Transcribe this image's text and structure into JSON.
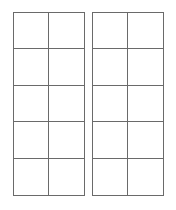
{
  "diagram": {
    "type": "ten-frames",
    "frames": [
      {
        "id": "left",
        "rows": 5,
        "columns": 2,
        "filled_cells": 0
      },
      {
        "id": "right",
        "rows": 5,
        "columns": 2,
        "filled_cells": 0
      }
    ],
    "colors": {
      "line": "#6a6a6a",
      "background": "#ffffff"
    }
  }
}
